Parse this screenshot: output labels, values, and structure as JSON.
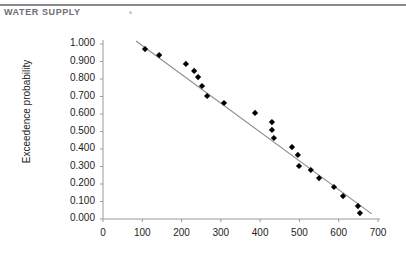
{
  "header": {
    "title": "Water Supply",
    "speck_icon": "dust-speck-icon"
  },
  "chart_data": {
    "type": "scatter",
    "title": "",
    "subtitle": "",
    "xlabel": "",
    "ylabel": "Exceedence probability",
    "xlim": [
      0,
      700
    ],
    "ylim": [
      0.0,
      1.0
    ],
    "xticks": [
      0,
      100,
      200,
      300,
      400,
      500,
      600,
      700
    ],
    "xtick_labels": [
      "0",
      "100",
      "200",
      "300",
      "400",
      "500",
      "600",
      "700"
    ],
    "yticks": [
      0.0,
      0.1,
      0.2,
      0.3,
      0.4,
      0.5,
      0.6,
      0.7,
      0.8,
      0.9,
      1.0
    ],
    "ytick_labels": [
      "0.000",
      "0.100",
      "0.200",
      "0.300",
      "0.400",
      "0.500",
      "0.600",
      "0.700",
      "0.800",
      "0.900",
      "1.000"
    ],
    "grid": false,
    "legend": false,
    "legend_position": "none",
    "marker": "diamond",
    "marker_color": "#000000",
    "series": [
      {
        "name": "Exceedence probability",
        "type": "scatter",
        "points": [
          [
            107,
            0.971
          ],
          [
            143,
            0.937
          ],
          [
            211,
            0.886
          ],
          [
            232,
            0.846
          ],
          [
            242,
            0.811
          ],
          [
            252,
            0.76
          ],
          [
            265,
            0.703
          ],
          [
            308,
            0.663
          ],
          [
            387,
            0.606
          ],
          [
            430,
            0.554
          ],
          [
            430,
            0.509
          ],
          [
            435,
            0.463
          ],
          [
            481,
            0.411
          ],
          [
            496,
            0.366
          ],
          [
            499,
            0.303
          ],
          [
            529,
            0.28
          ],
          [
            550,
            0.234
          ],
          [
            588,
            0.183
          ],
          [
            611,
            0.131
          ],
          [
            649,
            0.074
          ],
          [
            654,
            0.034
          ]
        ]
      },
      {
        "name": "trend-line",
        "type": "line",
        "color": "#8c8c8c",
        "endpoints": [
          [
            84,
            1.017
          ],
          [
            684,
            0.029
          ]
        ]
      }
    ]
  }
}
